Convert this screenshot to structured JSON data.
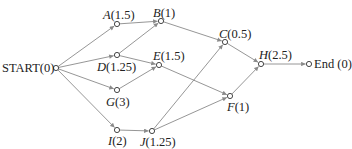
{
  "diagram": {
    "type": "activity-network",
    "edge_color": "#8a8a8a",
    "node_color": "#333333",
    "nodes": [
      {
        "id": "START",
        "name": "START",
        "duration": "0",
        "label": "START(0)",
        "x": 56,
        "y": 68,
        "lx": 2,
        "ly": 62,
        "italic": false
      },
      {
        "id": "A",
        "name": "A",
        "duration": "1.5",
        "label": "A(1.5)",
        "x": 117,
        "y": 24,
        "lx": 103,
        "ly": 9,
        "italic": true
      },
      {
        "id": "B",
        "name": "B",
        "duration": "1",
        "label": "B(1)",
        "x": 161,
        "y": 21,
        "lx": 153,
        "ly": 7,
        "italic": true
      },
      {
        "id": "C",
        "name": "C",
        "duration": "0.5",
        "label": "C(0.5)",
        "x": 225,
        "y": 42,
        "lx": 219,
        "ly": 28,
        "italic": true
      },
      {
        "id": "D",
        "name": "D",
        "duration": "1.25",
        "label": "D(1.25)",
        "x": 117,
        "y": 55,
        "lx": 97,
        "ly": 61,
        "italic": true
      },
      {
        "id": "E",
        "name": "E",
        "duration": "1.5",
        "label": "E(1.5)",
        "x": 159,
        "y": 65,
        "lx": 153,
        "ly": 50,
        "italic": true
      },
      {
        "id": "F",
        "name": "F",
        "duration": "1",
        "label": "F(1)",
        "x": 230,
        "y": 96,
        "lx": 227,
        "ly": 101,
        "italic": true
      },
      {
        "id": "G",
        "name": "G",
        "duration": "3",
        "label": "G(3)",
        "x": 117,
        "y": 90,
        "lx": 106,
        "ly": 96,
        "italic": true
      },
      {
        "id": "H",
        "name": "H",
        "duration": "2.5",
        "label": "H(2.5)",
        "x": 261,
        "y": 64,
        "lx": 259,
        "ly": 49,
        "italic": true
      },
      {
        "id": "I",
        "name": "I",
        "duration": "2",
        "label": "I(2)",
        "x": 117,
        "y": 130,
        "lx": 108,
        "ly": 135,
        "italic": true
      },
      {
        "id": "J",
        "name": "J",
        "duration": "1.25",
        "label": "J(1.25)",
        "x": 152,
        "y": 131,
        "lx": 140,
        "ly": 136,
        "italic": true
      },
      {
        "id": "END",
        "name": "End",
        "duration": "0",
        "label": "End (0)",
        "x": 309,
        "y": 64,
        "lx": 314,
        "ly": 58,
        "italic": false
      }
    ],
    "edges": [
      {
        "from": "START",
        "to": "A"
      },
      {
        "from": "START",
        "to": "D"
      },
      {
        "from": "START",
        "to": "G"
      },
      {
        "from": "START",
        "to": "I"
      },
      {
        "from": "A",
        "to": "B"
      },
      {
        "from": "D",
        "to": "B"
      },
      {
        "from": "D",
        "to": "E"
      },
      {
        "from": "G",
        "to": "E"
      },
      {
        "from": "B",
        "to": "C"
      },
      {
        "from": "E",
        "to": "F"
      },
      {
        "from": "I",
        "to": "J"
      },
      {
        "from": "J",
        "to": "C"
      },
      {
        "from": "J",
        "to": "F"
      },
      {
        "from": "C",
        "to": "H"
      },
      {
        "from": "F",
        "to": "H"
      },
      {
        "from": "H",
        "to": "END"
      }
    ]
  }
}
